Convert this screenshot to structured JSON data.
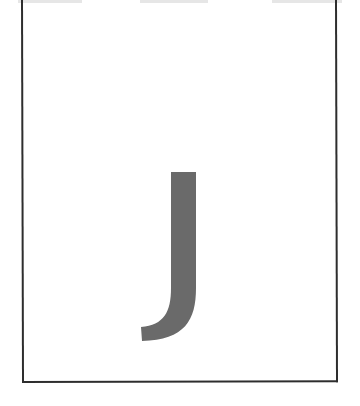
{
  "card": {
    "letter": "J",
    "letter_color": "#6a6a6a",
    "border_color": "#2e2e2e",
    "background": "#ffffff"
  }
}
